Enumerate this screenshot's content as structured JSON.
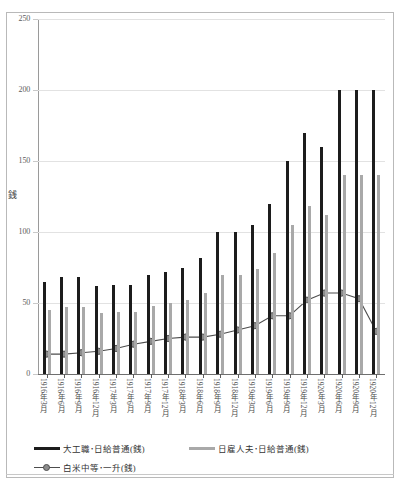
{
  "axis": {
    "y_title": "銭",
    "y_ticks": [
      0,
      50,
      100,
      150,
      200,
      250
    ],
    "y_min": 0,
    "y_max": 250
  },
  "legend": {
    "items": [
      {
        "key": "daiku",
        "label": "大工職･日給普通(銭)",
        "marker": "dark-bar"
      },
      {
        "key": "hiyatoi",
        "label": "日雇人夫･日給普通(銭)",
        "marker": "light-bar"
      },
      {
        "key": "kome",
        "label": "白米中等･一升(銭)",
        "marker": "line-marker"
      }
    ]
  },
  "chart_data": {
    "type": "bar",
    "title": "",
    "xlabel": "",
    "ylabel": "銭",
    "ylim": [
      0,
      250
    ],
    "grid": true,
    "legend_position": "bottom-left",
    "categories": [
      "1916年3月",
      "1916年6月",
      "1916年9月",
      "1916年12月",
      "1917年3月",
      "1917年6月",
      "1917年9月",
      "1917年12月",
      "1918年3月",
      "1918年6月",
      "1918年9月",
      "1918年12月",
      "1919年3月",
      "1919年6月",
      "1919年9月",
      "1919年12月",
      "1920年3月",
      "1920年6月",
      "1920年9月",
      "1920年12月"
    ],
    "series": [
      {
        "name": "大工職･日給普通(銭)",
        "type": "bar",
        "color": "#1c1c1c",
        "values": [
          65,
          68,
          68,
          62,
          63,
          63,
          70,
          72,
          75,
          82,
          100,
          100,
          105,
          120,
          150,
          170,
          160,
          200,
          200,
          200
        ]
      },
      {
        "name": "日雇人夫･日給普通(銭)",
        "type": "bar",
        "color": "#a9a9a9",
        "values": [
          45,
          47,
          47,
          43,
          44,
          44,
          48,
          50,
          52,
          57,
          70,
          70,
          74,
          85,
          105,
          118,
          112,
          140,
          140,
          140
        ]
      },
      {
        "name": "白米中等･一升(銭)",
        "type": "line",
        "color": "#4d4d4d",
        "marker": "circle",
        "values": [
          14,
          14,
          15,
          16,
          18,
          21,
          23,
          25,
          26,
          26,
          28,
          31,
          34,
          41,
          41,
          52,
          57,
          57,
          53,
          30
        ]
      }
    ]
  }
}
